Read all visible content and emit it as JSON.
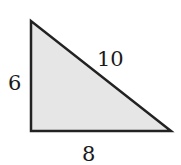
{
  "diagram": {
    "type": "right-triangle",
    "fill_color": "#e6e6e6",
    "stroke_color": "#222222",
    "sides": {
      "vertical": "6",
      "hypotenuse": "10",
      "horizontal": "8"
    }
  }
}
